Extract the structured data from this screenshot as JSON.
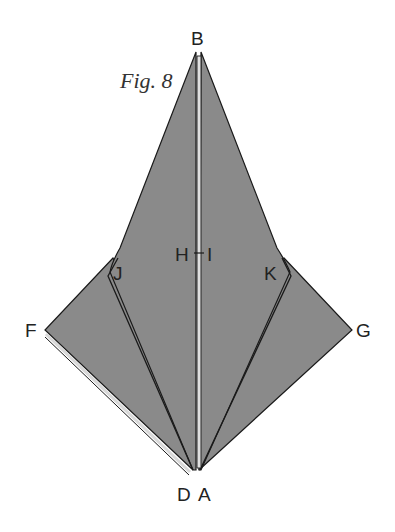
{
  "figure": {
    "title": "Fig. 8",
    "colors": {
      "paper": "#8a8a8a",
      "crease": "#1a1a1a",
      "edge_highlight": "#d8d8d8",
      "background": "#ffffff"
    },
    "points": {
      "B": "B",
      "F": "F",
      "G": "G",
      "D": "D",
      "A": "A",
      "H": "H",
      "I": "I",
      "J": "J",
      "K": "K"
    }
  }
}
